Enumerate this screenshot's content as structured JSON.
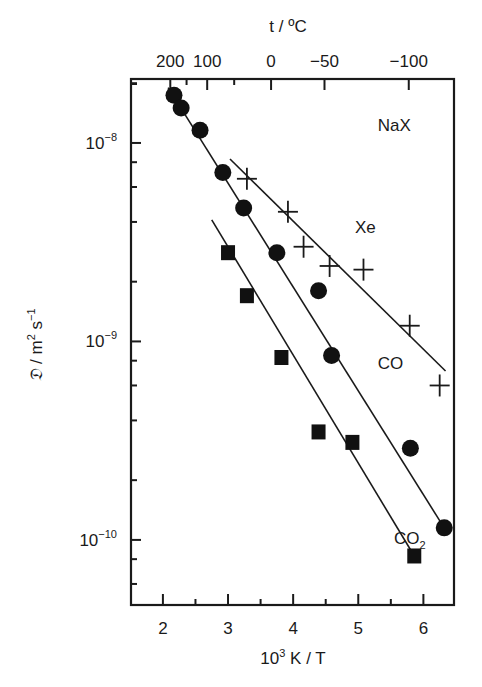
{
  "chart_data": {
    "type": "scatter",
    "title": "NaX",
    "xlabel": "10³ K / T",
    "xlabel_parts": {
      "base": "10",
      "sup": "3",
      "rest": " K / T"
    },
    "ylabel": "𝔇 / m² s⁻¹",
    "ylabel_parts": {
      "sym": "𝔇",
      "unit1": " / m",
      "sup1": "2",
      "unit2": " s",
      "sup2": "−1"
    },
    "top_axis_label": "t / ºC",
    "xlim": [
      1.51,
      6.47
    ],
    "ylim": [
      4.7e-11,
      2.1e-08
    ],
    "yscale": "log",
    "grid": false,
    "x_ticks": [
      2,
      3,
      4,
      5,
      6
    ],
    "x_tick_labels": [
      "2",
      "3",
      "4",
      "5",
      "6"
    ],
    "x_minor_ticks": [
      2.5,
      3.5,
      4.5,
      5.5
    ],
    "y_ticks": [
      1e-08,
      1e-09,
      1e-10
    ],
    "y_tick_labels": [
      {
        "base": "10",
        "exp": "−8"
      },
      {
        "base": "10",
        "exp": "−9"
      },
      {
        "base": "10",
        "exp": "−10"
      }
    ],
    "top_ticks_celsius": [
      200,
      100,
      0,
      -50,
      -100
    ],
    "top_tick_labels": [
      "200",
      "100",
      "0",
      "−50",
      "−100"
    ],
    "top_minor_ticks_celsius": [
      150,
      50
    ],
    "series": [
      {
        "name": "CO",
        "marker": "circle",
        "label": "CO",
        "points": [
          {
            "x": 2.17,
            "y": 1.74e-08
          },
          {
            "x": 2.28,
            "y": 1.5e-08
          },
          {
            "x": 2.57,
            "y": 1.16e-08
          },
          {
            "x": 2.92,
            "y": 7.1e-09
          },
          {
            "x": 3.24,
            "y": 4.7e-09
          },
          {
            "x": 3.75,
            "y": 2.8e-09
          },
          {
            "x": 4.39,
            "y": 1.8e-09
          },
          {
            "x": 4.59,
            "y": 8.5e-10
          },
          {
            "x": 5.8,
            "y": 2.9e-10
          },
          {
            "x": 6.32,
            "y": 1.15e-10
          }
        ],
        "fit_line": [
          {
            "x": 2.08,
            "y": 1.9e-08
          },
          {
            "x": 6.32,
            "y": 1.15e-10
          }
        ]
      },
      {
        "name": "Xe",
        "marker": "cross",
        "label": "Xe",
        "points": [
          {
            "x": 3.29,
            "y": 6.6e-09
          },
          {
            "x": 3.92,
            "y": 4.5e-09
          },
          {
            "x": 4.16,
            "y": 3e-09
          },
          {
            "x": 4.56,
            "y": 2.4e-09
          },
          {
            "x": 5.08,
            "y": 2.3e-09
          },
          {
            "x": 5.79,
            "y": 1.2e-09
          },
          {
            "x": 6.25,
            "y": 6e-10
          }
        ],
        "fit_line": [
          {
            "x": 3.03,
            "y": 8.3e-09
          },
          {
            "x": 6.34,
            "y": 7.1e-10
          }
        ]
      },
      {
        "name": "CO2",
        "marker": "square",
        "label": "CO",
        "label_sub": "2",
        "points": [
          {
            "x": 3.0,
            "y": 2.8e-09
          },
          {
            "x": 3.29,
            "y": 1.7e-09
          },
          {
            "x": 3.82,
            "y": 8.3e-10
          },
          {
            "x": 4.39,
            "y": 3.5e-10
          },
          {
            "x": 4.91,
            "y": 3.1e-10
          },
          {
            "x": 5.86,
            "y": 8.3e-11
          }
        ],
        "fit_line": [
          {
            "x": 2.75,
            "y": 4.1e-09
          },
          {
            "x": 5.86,
            "y": 8.3e-11
          }
        ]
      }
    ],
    "annotations": [
      {
        "text": "NaX",
        "x": 5.3,
        "y": 1.15e-08
      },
      {
        "text": "Xe",
        "x": 4.95,
        "y": 3.5e-09
      },
      {
        "text": "CO",
        "x": 5.3,
        "y": 7.3e-10
      },
      {
        "text": "CO",
        "sub": "2",
        "x": 5.55,
        "y": 9.5e-11
      }
    ]
  }
}
